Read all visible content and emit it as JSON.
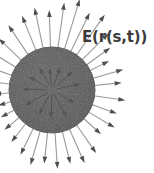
{
  "figure": {
    "kind": "vector-field-on-closed-surface",
    "background_color": "#ffffff",
    "label": {
      "text": "E(r(s,t))",
      "x": 82,
      "y": 30,
      "font_size": 15,
      "bold": true,
      "color": "#3b3b3b"
    },
    "surface": {
      "name": "sphere-blob",
      "shape": "circle",
      "cx": 52,
      "cy": 90,
      "r": 43,
      "fill_color": "#575757",
      "edge_color": "#4a4a4a",
      "speckle_color": "#6a6a6a"
    },
    "arrow_style": {
      "shaft_color": "#9a9a9a",
      "head_color": "#4e4e4e",
      "interior_arrow_color": "#3f3f3f",
      "shaft_width": 1.1,
      "head_length": 7,
      "head_half_width": 2.3
    },
    "exterior_arrows": [
      {
        "angle_deg": 268,
        "start_r": 40,
        "length": 40
      },
      {
        "angle_deg": 278,
        "start_r": 40,
        "length": 48
      },
      {
        "angle_deg": 287,
        "start_r": 40,
        "length": 55
      },
      {
        "angle_deg": 296,
        "start_r": 40,
        "length": 46
      },
      {
        "angle_deg": 305,
        "start_r": 40,
        "length": 52
      },
      {
        "angle_deg": 315,
        "start_r": 40,
        "length": 40
      },
      {
        "angle_deg": 324,
        "start_r": 40,
        "length": 32
      },
      {
        "angle_deg": 333,
        "start_r": 40,
        "length": 24
      },
      {
        "angle_deg": 344,
        "start_r": 40,
        "length": 34
      },
      {
        "angle_deg": 354,
        "start_r": 40,
        "length": 30
      },
      {
        "angle_deg": 8,
        "start_r": 40,
        "length": 34
      },
      {
        "angle_deg": 20,
        "start_r": 40,
        "length": 29
      },
      {
        "angle_deg": 31,
        "start_r": 40,
        "length": 33
      },
      {
        "angle_deg": 42,
        "start_r": 40,
        "length": 26
      },
      {
        "angle_deg": 55,
        "start_r": 40,
        "length": 37
      },
      {
        "angle_deg": 66,
        "start_r": 40,
        "length": 40
      },
      {
        "angle_deg": 76,
        "start_r": 40,
        "length": 36
      },
      {
        "angle_deg": 86,
        "start_r": 40,
        "length": 39
      },
      {
        "angle_deg": 96,
        "start_r": 40,
        "length": 34
      },
      {
        "angle_deg": 106,
        "start_r": 40,
        "length": 38
      },
      {
        "angle_deg": 116,
        "start_r": 40,
        "length": 32
      },
      {
        "angle_deg": 128,
        "start_r": 40,
        "length": 26
      },
      {
        "angle_deg": 140,
        "start_r": 40,
        "length": 22
      },
      {
        "angle_deg": 152,
        "start_r": 40,
        "length": 18
      },
      {
        "angle_deg": 164,
        "start_r": 40,
        "length": 16
      },
      {
        "angle_deg": 176,
        "start_r": 40,
        "length": 18
      },
      {
        "angle_deg": 188,
        "start_r": 40,
        "length": 22
      },
      {
        "angle_deg": 200,
        "start_r": 40,
        "length": 26
      },
      {
        "angle_deg": 212,
        "start_r": 40,
        "length": 30
      },
      {
        "angle_deg": 224,
        "start_r": 40,
        "length": 34
      },
      {
        "angle_deg": 236,
        "start_r": 40,
        "length": 38
      },
      {
        "angle_deg": 248,
        "start_r": 40,
        "length": 40
      },
      {
        "angle_deg": 258,
        "start_r": 40,
        "length": 44
      }
    ],
    "interior_arrows": [
      {
        "angle_deg": 290,
        "start_r": 4,
        "length": 20
      },
      {
        "angle_deg": 318,
        "start_r": 6,
        "length": 22
      },
      {
        "angle_deg": 348,
        "start_r": 5,
        "length": 24
      },
      {
        "angle_deg": 30,
        "start_r": 6,
        "length": 20
      },
      {
        "angle_deg": 62,
        "start_r": 5,
        "length": 26
      },
      {
        "angle_deg": 92,
        "start_r": 4,
        "length": 24
      },
      {
        "angle_deg": 118,
        "start_r": 6,
        "length": 22
      },
      {
        "angle_deg": 150,
        "start_r": 5,
        "length": 26
      },
      {
        "angle_deg": 182,
        "start_r": 6,
        "length": 24
      },
      {
        "angle_deg": 210,
        "start_r": 5,
        "length": 22
      },
      {
        "angle_deg": 240,
        "start_r": 6,
        "length": 20
      },
      {
        "angle_deg": 264,
        "start_r": 4,
        "length": 18
      }
    ]
  }
}
